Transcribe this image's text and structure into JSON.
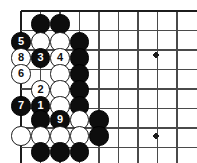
{
  "diagram": {
    "type": "go-board-problem",
    "board": {
      "edges_shown": [
        "top",
        "left"
      ],
      "line_color": "#4a4a4a",
      "edge_line_color": "#1c1c1c",
      "background_color": "#ffffff",
      "origin_x": 21,
      "origin_y": 11,
      "spacing": 19.5,
      "columns": 9,
      "rows": 8,
      "col_x": [
        21,
        40.5,
        60,
        79.5,
        99,
        118.5,
        138,
        157.5,
        177
      ],
      "row_y": [
        11,
        30.5,
        50,
        69.5,
        89,
        108.5,
        128,
        147.5
      ],
      "star_points": [
        {
          "name": "star-point-upper",
          "x": 156,
          "y": 55,
          "r": 2.6
        },
        {
          "name": "star-point-lower",
          "x": 156,
          "y": 136,
          "r": 2.6
        }
      ]
    },
    "stone_radius": 9.6,
    "stones": [
      {
        "id": "s-b-c1r1",
        "color": "black",
        "label": "",
        "x": 40.5,
        "y": 24
      },
      {
        "id": "s-b-c2r1",
        "color": "black",
        "label": "",
        "x": 60,
        "y": 24
      },
      {
        "id": "s-b-5",
        "color": "black",
        "label": "5",
        "x": 21,
        "y": 42
      },
      {
        "id": "s-w-c1r2",
        "color": "white",
        "label": "",
        "x": 40.5,
        "y": 42
      },
      {
        "id": "s-w-c2r2",
        "color": "white",
        "label": "",
        "x": 60,
        "y": 42
      },
      {
        "id": "s-b-c3r2",
        "color": "black",
        "label": "",
        "x": 79.5,
        "y": 42
      },
      {
        "id": "s-w-8",
        "color": "white",
        "label": "8",
        "x": 21,
        "y": 58
      },
      {
        "id": "s-b-3",
        "color": "black",
        "label": "3",
        "x": 40.5,
        "y": 58
      },
      {
        "id": "s-w-4",
        "color": "white",
        "label": "4",
        "x": 60,
        "y": 58
      },
      {
        "id": "s-b-c3r3",
        "color": "black",
        "label": "",
        "x": 79.5,
        "y": 58
      },
      {
        "id": "s-w-6",
        "color": "white",
        "label": "6",
        "x": 21,
        "y": 74
      },
      {
        "id": "s-w-c2r4",
        "color": "white",
        "label": "",
        "x": 60,
        "y": 74
      },
      {
        "id": "s-b-c3r4",
        "color": "black",
        "label": "",
        "x": 79.5,
        "y": 74
      },
      {
        "id": "s-w-2",
        "color": "white",
        "label": "2",
        "x": 40.5,
        "y": 90
      },
      {
        "id": "s-w-c2r5",
        "color": "white",
        "label": "",
        "x": 60,
        "y": 90
      },
      {
        "id": "s-b-c3r5",
        "color": "black",
        "label": "",
        "x": 79.5,
        "y": 90
      },
      {
        "id": "s-b-7",
        "color": "black",
        "label": "7",
        "x": 21,
        "y": 106
      },
      {
        "id": "s-b-1",
        "color": "black",
        "label": "1",
        "x": 40.5,
        "y": 106
      },
      {
        "id": "s-w-c2r6",
        "color": "white",
        "label": "",
        "x": 60,
        "y": 106
      },
      {
        "id": "s-b-c3r6",
        "color": "black",
        "label": "",
        "x": 79.5,
        "y": 106
      },
      {
        "id": "s-b-c1r7",
        "color": "black",
        "label": "",
        "x": 40.5,
        "y": 120
      },
      {
        "id": "s-b-9",
        "color": "black",
        "label": "9",
        "x": 60,
        "y": 120
      },
      {
        "id": "s-w-c3r7",
        "color": "white",
        "label": "",
        "x": 79.5,
        "y": 120
      },
      {
        "id": "s-b-c4r7",
        "color": "black",
        "label": "",
        "x": 99,
        "y": 120
      },
      {
        "id": "s-w-c0r8",
        "color": "white",
        "label": "",
        "x": 21,
        "y": 136
      },
      {
        "id": "s-w-c1r8",
        "color": "white",
        "label": "",
        "x": 40.5,
        "y": 136
      },
      {
        "id": "s-w-c2r8",
        "color": "white",
        "label": "",
        "x": 60,
        "y": 136
      },
      {
        "id": "s-w-c3r8",
        "color": "white",
        "label": "",
        "x": 79.5,
        "y": 136
      },
      {
        "id": "s-b-c4r8",
        "color": "black",
        "label": "",
        "x": 99,
        "y": 136
      },
      {
        "id": "s-b-c1r9",
        "color": "black",
        "label": "",
        "x": 40.5,
        "y": 152
      },
      {
        "id": "s-b-c2r9",
        "color": "black",
        "label": "",
        "x": 60,
        "y": 152
      },
      {
        "id": "s-b-c3r9",
        "color": "black",
        "label": "",
        "x": 79.5,
        "y": 152
      }
    ]
  }
}
